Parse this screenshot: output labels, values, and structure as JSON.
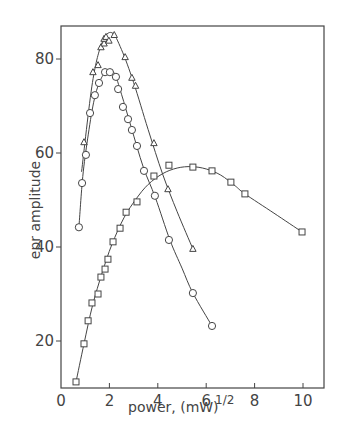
{
  "chart_data": {
    "type": "scatter",
    "title": "",
    "xlabel": "power, (mW)",
    "xlabel_superscript": "1/2",
    "ylabel": "epr amplitude",
    "xlim": [
      0,
      10.9
    ],
    "ylim": [
      10,
      87
    ],
    "x_ticks": [
      0,
      2,
      4,
      6,
      8,
      10
    ],
    "y_ticks": [
      20,
      40,
      60,
      80
    ],
    "grid": false,
    "legend": null,
    "series": [
      {
        "name": "triangles",
        "marker": "triangle",
        "x": [
          0.95,
          1.32,
          1.53,
          1.65,
          1.78,
          1.78,
          1.86,
          1.98,
          2.2,
          2.65,
          2.93,
          3.08,
          3.84,
          4.42,
          5.45
        ],
        "y": [
          62.3,
          77.2,
          78.7,
          82.5,
          83.3,
          84.3,
          84.7,
          83.9,
          85.1,
          80.4,
          76.0,
          74.3,
          62.1,
          52.3,
          39.6
        ]
      },
      {
        "name": "circles",
        "marker": "circle",
        "x": [
          0.74,
          0.87,
          1.03,
          1.2,
          1.4,
          1.57,
          1.82,
          2.02,
          2.27,
          2.36,
          2.56,
          2.77,
          2.93,
          3.14,
          3.43,
          3.88,
          4.46,
          5.45,
          6.24
        ],
        "y": [
          44.2,
          53.6,
          59.6,
          68.5,
          72.3,
          74.9,
          77.2,
          77.2,
          76.2,
          73.6,
          69.8,
          67.2,
          64.9,
          61.5,
          56.2,
          50.9,
          41.5,
          30.2,
          23.2
        ]
      },
      {
        "name": "squares",
        "marker": "square",
        "x": [
          0.62,
          0.95,
          1.12,
          1.28,
          1.53,
          1.65,
          1.82,
          1.94,
          2.15,
          2.44,
          2.69,
          3.14,
          3.84,
          4.46,
          5.45,
          6.24,
          7.02,
          7.6,
          9.96
        ],
        "y": [
          11.3,
          19.4,
          24.3,
          28.1,
          30.0,
          33.6,
          35.3,
          37.4,
          41.1,
          44.0,
          47.4,
          49.6,
          55.1,
          57.4,
          57.0,
          56.2,
          53.8,
          51.3,
          43.2
        ]
      }
    ],
    "curves": [
      {
        "name": "triangle-fit",
        "x": [
          0.85,
          1.3,
          1.7,
          2.1,
          2.5,
          3.0,
          3.6,
          4.2,
          4.8,
          5.45
        ],
        "y": [
          56,
          75,
          83.5,
          85.6,
          82,
          75,
          65,
          55.5,
          47.5,
          39.6
        ]
      },
      {
        "name": "circle-fit",
        "x": [
          0.74,
          0.9,
          1.1,
          1.35,
          1.6,
          1.9,
          2.2,
          2.5,
          2.9,
          3.4,
          3.9,
          4.5,
          5.0,
          5.45,
          6.24
        ],
        "y": [
          44.2,
          55,
          63,
          70.8,
          75.2,
          77.5,
          77,
          72.5,
          65.5,
          57,
          50.5,
          41.5,
          35.5,
          30.2,
          23.2
        ]
      },
      {
        "name": "square-fit",
        "x": [
          0.62,
          0.95,
          1.3,
          1.7,
          2.1,
          2.6,
          3.1,
          3.6,
          4.2,
          4.8,
          5.4,
          6.0,
          6.6,
          7.2,
          7.6,
          8.8,
          9.96
        ],
        "y": [
          11.3,
          19.4,
          27.5,
          34.5,
          40.5,
          46.2,
          50.2,
          53.3,
          55.6,
          56.8,
          57.1,
          56.6,
          55.3,
          53.0,
          51.3,
          47.2,
          43.2
        ]
      }
    ]
  },
  "axes": {
    "x_tick_labels": [
      "0",
      "2",
      "4",
      "6",
      "8",
      "10"
    ],
    "y_tick_labels": [
      "20",
      "40",
      "60",
      "80"
    ],
    "x_title": "power, (mW)",
    "x_title_sup": "1/2",
    "y_title": "epr amplitude"
  },
  "colors": {
    "ink": "#444444",
    "background": "#ffffff"
  }
}
